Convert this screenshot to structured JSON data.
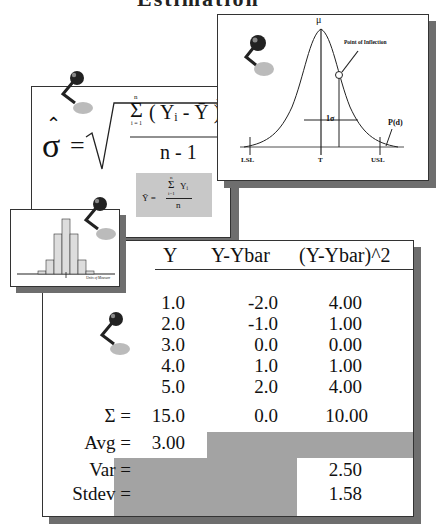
{
  "header": {
    "title": "Estimation"
  },
  "normal_curve": {
    "mu_label": "μ",
    "inflection_label": "Point of Inflection",
    "sigma_label": "1σ",
    "pd_label": "P(d)",
    "lsl_label": "LSL",
    "target_label": "T",
    "usl_label": "USL"
  },
  "formula": {
    "sigma_hat": "σ",
    "equals": "=",
    "sum_top": "n",
    "sum_bottom": "i = 1",
    "sum_symbol": "Σ",
    "numerator": "( Yᵢ - Ȳ )",
    "exponent": "2",
    "denominator": "n - 1",
    "mean_formula": {
      "lhs": "Ȳ =",
      "sum_symbol": "Σ",
      "sum_top": "n",
      "sum_bottom": "i=1",
      "numerator": "Yᵢ",
      "denominator": "n"
    }
  },
  "histogram": {
    "axis_label": "Units of Measure",
    "bars": [
      3,
      8,
      22,
      42,
      58,
      42,
      22,
      8,
      3
    ]
  },
  "table": {
    "headers": [
      "Y",
      "Y-Ybar",
      "(Y-Ybar)^2"
    ],
    "rows": [
      [
        "1.0",
        "-2.0",
        "4.00"
      ],
      [
        "2.0",
        "-1.0",
        "1.00"
      ],
      [
        "3.0",
        "0.0",
        "0.00"
      ],
      [
        "4.0",
        "1.0",
        "1.00"
      ],
      [
        "5.0",
        "2.0",
        "4.00"
      ]
    ],
    "sum": {
      "label": "Σ =",
      "values": [
        "15.0",
        "0.0",
        "10.00"
      ]
    },
    "avg": {
      "label": "Avg =",
      "value": "3.00"
    },
    "var": {
      "label": "Var =",
      "value": "2.50"
    },
    "stdev": {
      "label": "Stdev =",
      "value": "1.58"
    }
  }
}
